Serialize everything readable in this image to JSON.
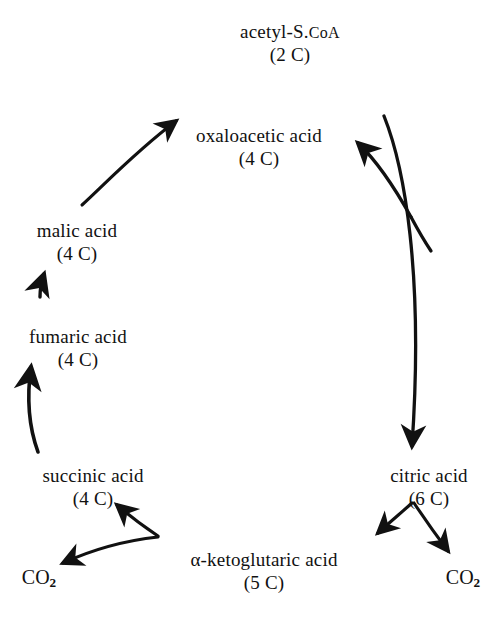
{
  "diagram": {
    "background_color": "#ffffff",
    "ink_color": "#111111"
  },
  "nodes": {
    "acetyl_coa": {
      "name_prefix": "acetyl-S.",
      "name_smallcaps": "CoA",
      "count": "(2 C)",
      "x": 290,
      "y": 20
    },
    "oxaloacetic": {
      "name": "oxaloacetic acid",
      "count": "(4 C)",
      "x": 259,
      "y": 124
    },
    "malic": {
      "name": "malic acid",
      "count": "(4 C)",
      "x": 77,
      "y": 219
    },
    "fumaric": {
      "name": "fumaric acid",
      "count": "(4 C)",
      "x": 78,
      "y": 325
    },
    "succinic": {
      "name": "succinic acid",
      "count": "(4 C)",
      "x": 93,
      "y": 464
    },
    "ketoglutaric": {
      "name": "α-ketoglutaric acid",
      "count": "(5 C)",
      "x": 264,
      "y": 548
    },
    "citric": {
      "name": "citric acid",
      "count": "(6 C)",
      "x": 429,
      "y": 464
    }
  },
  "byproducts": {
    "co2_left": {
      "formula": "CO",
      "subscript": "2",
      "x": 39,
      "y": 566
    },
    "co2_right": {
      "formula": "CO",
      "subscript": "2",
      "x": 463,
      "y": 566
    }
  },
  "arrows": [
    {
      "name": "malic-to-oxaloacetic",
      "from": "malic acid",
      "to": "oxaloacetic acid"
    },
    {
      "name": "oxaloacetic-to-citric",
      "from": "oxaloacetic acid",
      "to": "citric acid"
    },
    {
      "name": "acetyl-coa-inflow",
      "from": "acetyl-S.CoA",
      "to": "citric acid junction"
    },
    {
      "name": "citric-to-ketoglutaric",
      "from": "citric acid",
      "to": "α-ketoglutaric acid"
    },
    {
      "name": "citric-to-co2",
      "from": "citric acid",
      "to": "CO2"
    },
    {
      "name": "ketoglutaric-to-succinic",
      "from": "α-ketoglutaric acid",
      "to": "succinic acid"
    },
    {
      "name": "ketoglutaric-to-co2",
      "from": "α-ketoglutaric acid",
      "to": "CO2"
    },
    {
      "name": "succinic-to-fumaric",
      "from": "succinic acid",
      "to": "fumaric acid"
    },
    {
      "name": "fumaric-to-malic",
      "from": "fumaric acid",
      "to": "malic acid"
    }
  ]
}
